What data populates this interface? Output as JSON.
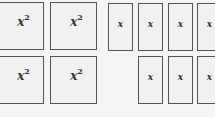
{
  "tiles": {
    "squares": [
      {
        "label": "x",
        "exp": "2"
      },
      {
        "label": "x",
        "exp": "2"
      },
      {
        "label": "x",
        "exp": "2"
      },
      {
        "label": "x",
        "exp": "2"
      }
    ],
    "rects": [
      {
        "label": "x"
      },
      {
        "label": "x"
      },
      {
        "label": "x"
      },
      {
        "label": "x"
      },
      {
        "label": "x"
      },
      {
        "label": "x"
      },
      {
        "label": "x"
      }
    ]
  }
}
